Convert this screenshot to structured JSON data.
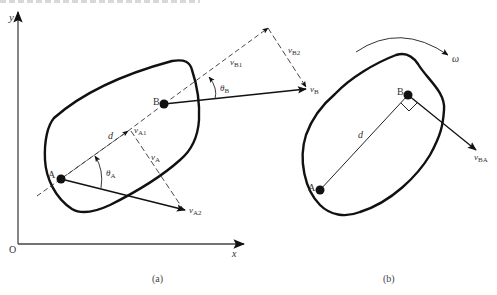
{
  "figure": {
    "panel_a": {
      "caption": "(a)",
      "axes": {
        "origin_label": "O",
        "x_label": "x",
        "y_label": "y"
      },
      "points": {
        "A": "A",
        "B": "B"
      },
      "labels": {
        "d": "d",
        "vA1": {
          "main": "v",
          "sub": "A1"
        },
        "vA": {
          "main": "v",
          "sub": "A"
        },
        "vA2": {
          "main": "v",
          "sub": "A2"
        },
        "thetaA": {
          "main": "θ",
          "sub": "A"
        },
        "vB1": {
          "main": "v",
          "sub": "B1"
        },
        "vB2": {
          "main": "v",
          "sub": "B2"
        },
        "vB": {
          "main": "v",
          "sub": "B"
        },
        "thetaB": {
          "main": "θ",
          "sub": "B"
        }
      }
    },
    "panel_b": {
      "caption": "(b)",
      "points": {
        "A": "A",
        "B": "B"
      },
      "labels": {
        "d": "d",
        "omega": "ω",
        "vBA": {
          "main": "v",
          "sub": "BA"
        }
      }
    }
  }
}
